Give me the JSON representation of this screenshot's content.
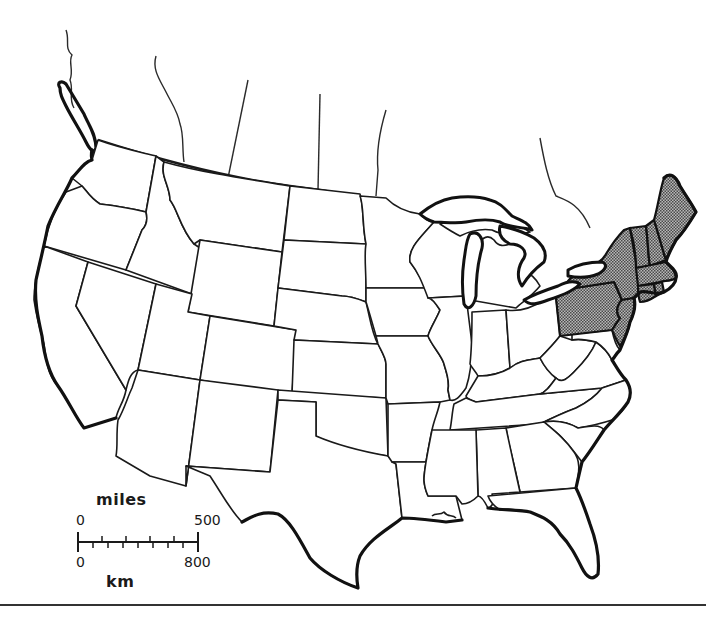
{
  "map": {
    "title": "",
    "subject": "Contiguous United States",
    "highlighted_region": "Northeast",
    "highlighted_states": [
      "Maine",
      "New Hampshire",
      "Vermont",
      "Massachusetts",
      "Rhode Island",
      "Connecticut",
      "New York",
      "New Jersey",
      "Pennsylvania"
    ],
    "highlight_style": "stipple",
    "colors": {
      "background": "#ffffff",
      "lines": "#1a1a1a",
      "highlight": "#8a8a8a"
    }
  },
  "scale_bar": {
    "top_unit": "miles",
    "top_start": "0",
    "top_end": "500",
    "bottom_unit": "km",
    "bottom_start": "0",
    "bottom_end": "800"
  }
}
